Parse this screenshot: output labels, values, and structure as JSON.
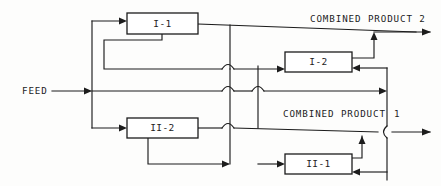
{
  "diagram": {
    "type": "process-flowsheet",
    "title": "",
    "canvas": {
      "width": 441,
      "height": 186
    },
    "units": [
      {
        "id": "I-1",
        "label": "I-1",
        "x": 127,
        "y": 13,
        "w": 71,
        "h": 21
      },
      {
        "id": "I-2",
        "label": "I-2",
        "x": 285,
        "y": 52,
        "w": 67,
        "h": 20
      },
      {
        "id": "II-2",
        "label": "II-2",
        "x": 127,
        "y": 118,
        "w": 71,
        "h": 20
      },
      {
        "id": "II-1",
        "label": "II-1",
        "x": 285,
        "y": 154,
        "w": 67,
        "h": 20
      }
    ],
    "streams": [
      {
        "id": "feed",
        "label": "FEED",
        "x": 22,
        "y": 91
      },
      {
        "id": "combined-product-2",
        "label": "COMBINED PRODUCT 2",
        "x": 310,
        "y": 22
      },
      {
        "id": "combined-product-1",
        "label": "COMBINED PRODUCT",
        "x": 283,
        "y": 117
      },
      {
        "id": "combined-product-1-number",
        "label": "1",
        "x": 394,
        "y": 117
      }
    ],
    "colors": {
      "line": "#1c1c1c",
      "box_fill": "#ffffff",
      "background": "#fdfdfc",
      "text": "#1c1c1c"
    }
  }
}
